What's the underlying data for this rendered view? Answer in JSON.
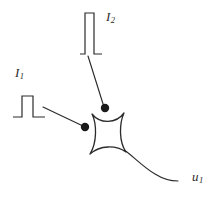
{
  "figure": {
    "background_color": "#ffffff",
    "stroke_color": "#2b2b2b",
    "dot_color": "#1a1a1a"
  },
  "labels": {
    "input_1": {
      "symbol": "I",
      "subscript": "1",
      "text": "I1"
    },
    "input_2": {
      "symbol": "I",
      "subscript": "2",
      "text": "I2"
    },
    "output_1": {
      "symbol": "u",
      "subscript": "1",
      "text": "u1"
    }
  },
  "signals": [
    {
      "name": "input-pulse-1",
      "label": "I1",
      "shape": "rectangular-pulse",
      "baseline_y": 117,
      "peak_y": 96,
      "x_start": 13,
      "x_rise": 22,
      "x_fall": 33,
      "x_end": 45,
      "amplitude_px": 21,
      "width_px": 11
    },
    {
      "name": "input-pulse-2",
      "label": "I2",
      "shape": "rectangular-pulse",
      "baseline_y": 54,
      "peak_y": 13,
      "x_start": 80,
      "x_rise": 85,
      "x_fall": 94,
      "x_end": 102,
      "amplitude_px": 41,
      "width_px": 9
    }
  ],
  "connectors": [
    {
      "name": "connector-i1-to-synapse",
      "from": [
        43,
        107
      ],
      "to": [
        83,
        126
      ]
    },
    {
      "name": "connector-i2-to-synapse",
      "from": [
        88,
        56
      ],
      "to": [
        104,
        107
      ]
    }
  ],
  "synapses": [
    {
      "name": "synapse-dot-1",
      "cx": 85,
      "cy": 127,
      "r": 4.2,
      "input": "I1"
    },
    {
      "name": "synapse-dot-2",
      "cx": 105,
      "cy": 108,
      "r": 4.2,
      "input": "I2"
    }
  ],
  "soma": {
    "name": "neuron-cell-body",
    "shape": "concave-four-point-star",
    "top_left": [
      92,
      114
    ],
    "top_right": [
      124,
      113
    ],
    "bottom_right": [
      126,
      152
    ],
    "bottom_left": [
      90,
      154
    ],
    "fill": "#ffffff"
  },
  "axon": {
    "name": "axon-output-curve",
    "start": [
      125,
      150
    ],
    "end": [
      178,
      181
    ],
    "label": "u1"
  }
}
